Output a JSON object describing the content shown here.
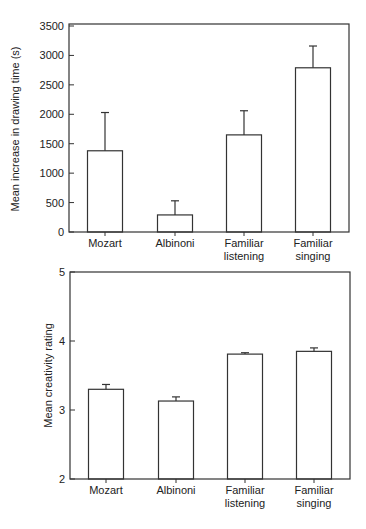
{
  "chart_data": [
    {
      "type": "bar",
      "title": "",
      "xlabel": "",
      "ylabel": "Mean increase in drawing time (s)",
      "categories": [
        "Mozart",
        "Albinoni",
        "Familiar listening",
        "Familiar singing"
      ],
      "category_lines": [
        [
          "Mozart"
        ],
        [
          "Albinoni"
        ],
        [
          "Familiar",
          "listening"
        ],
        [
          "Familiar",
          "singing"
        ]
      ],
      "values": [
        1380,
        290,
        1650,
        2790
      ],
      "error_upper": [
        2030,
        530,
        2060,
        3160
      ],
      "ylim": [
        0,
        3500
      ],
      "yticks": [
        0,
        500,
        1000,
        1500,
        2000,
        2500,
        3000,
        3500
      ],
      "grid": false,
      "legend": null
    },
    {
      "type": "bar",
      "title": "",
      "xlabel": "",
      "ylabel": "Mean creativity rating",
      "categories": [
        "Mozart",
        "Albinoni",
        "Familiar listening",
        "Familiar singing"
      ],
      "category_lines": [
        [
          "Mozart"
        ],
        [
          "Albinoni"
        ],
        [
          "Familiar",
          "listening"
        ],
        [
          "Familiar",
          "singing"
        ]
      ],
      "values": [
        3.3,
        3.13,
        3.81,
        3.85
      ],
      "error_upper": [
        3.37,
        3.19,
        3.83,
        3.9
      ],
      "ylim": [
        2,
        5
      ],
      "yticks": [
        2,
        3,
        4,
        5
      ],
      "grid": false,
      "legend": null
    }
  ],
  "style": {
    "bar_fill": "#ffffff",
    "stroke": "#333333",
    "background": "#ffffff"
  }
}
